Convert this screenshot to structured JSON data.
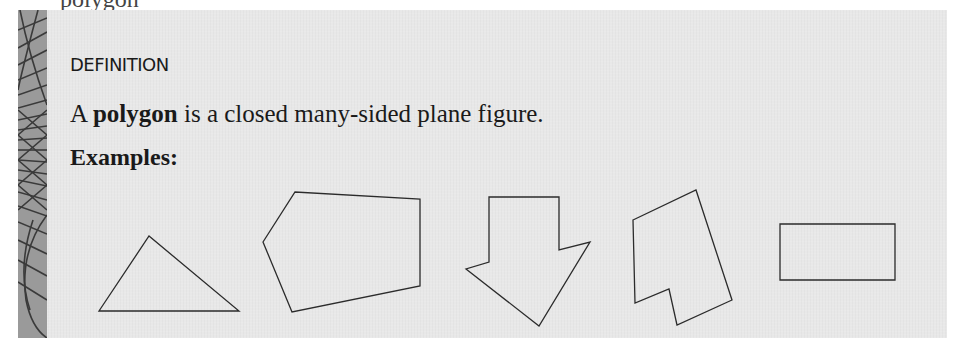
{
  "page": {
    "top_cutoff_text": "polygon"
  },
  "definition_box": {
    "label": "DEFINITION",
    "text_prefix": "A ",
    "term": "polygon",
    "text_suffix": " is a closed many-sided plane figure.",
    "examples_label": "Examples:",
    "colors": {
      "panel_background": "#e8e8e8",
      "strip_background": "#9a9a9a",
      "text": "#1a1a1a",
      "shape_stroke": "#2b2b2b"
    }
  },
  "shapes": [
    {
      "name": "triangle",
      "points": "99,311 149,236 239,311"
    },
    {
      "name": "pentagon",
      "points": "263,242 295,192 420,199 420,286 292,312"
    },
    {
      "name": "arrow-heptagon",
      "points": "489,197 559,197 559,250 590,242 539,326 466,269 489,262"
    },
    {
      "name": "irregular-hexagon",
      "points": "633,220 696,190 732,300 677,325 669,289 635,303"
    },
    {
      "name": "rectangle",
      "points": "780,224 895,224 895,280 780,280"
    }
  ]
}
